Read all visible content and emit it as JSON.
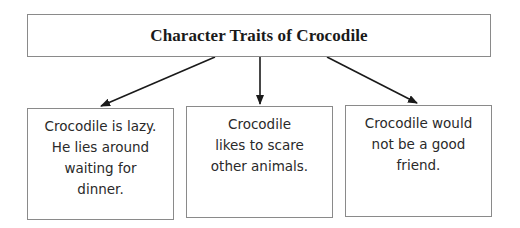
{
  "diagram": {
    "title": "Character Traits of Crocodile",
    "traits": [
      {
        "text": "Crocodile is lazy.\nHe lies around\nwaiting for\ndinner."
      },
      {
        "text": "Crocodile\nlikes to scare\nother animals."
      },
      {
        "text": "Crocodile would\nnot be a good\nfriend."
      }
    ],
    "arrows": [
      {
        "from": "title",
        "to": "trait-1"
      },
      {
        "from": "title",
        "to": "trait-2"
      },
      {
        "from": "title",
        "to": "trait-3"
      }
    ],
    "colors": {
      "border": "#8a8a8a",
      "arrow": "#1a1a1a",
      "text": "#2a2a2a"
    }
  }
}
